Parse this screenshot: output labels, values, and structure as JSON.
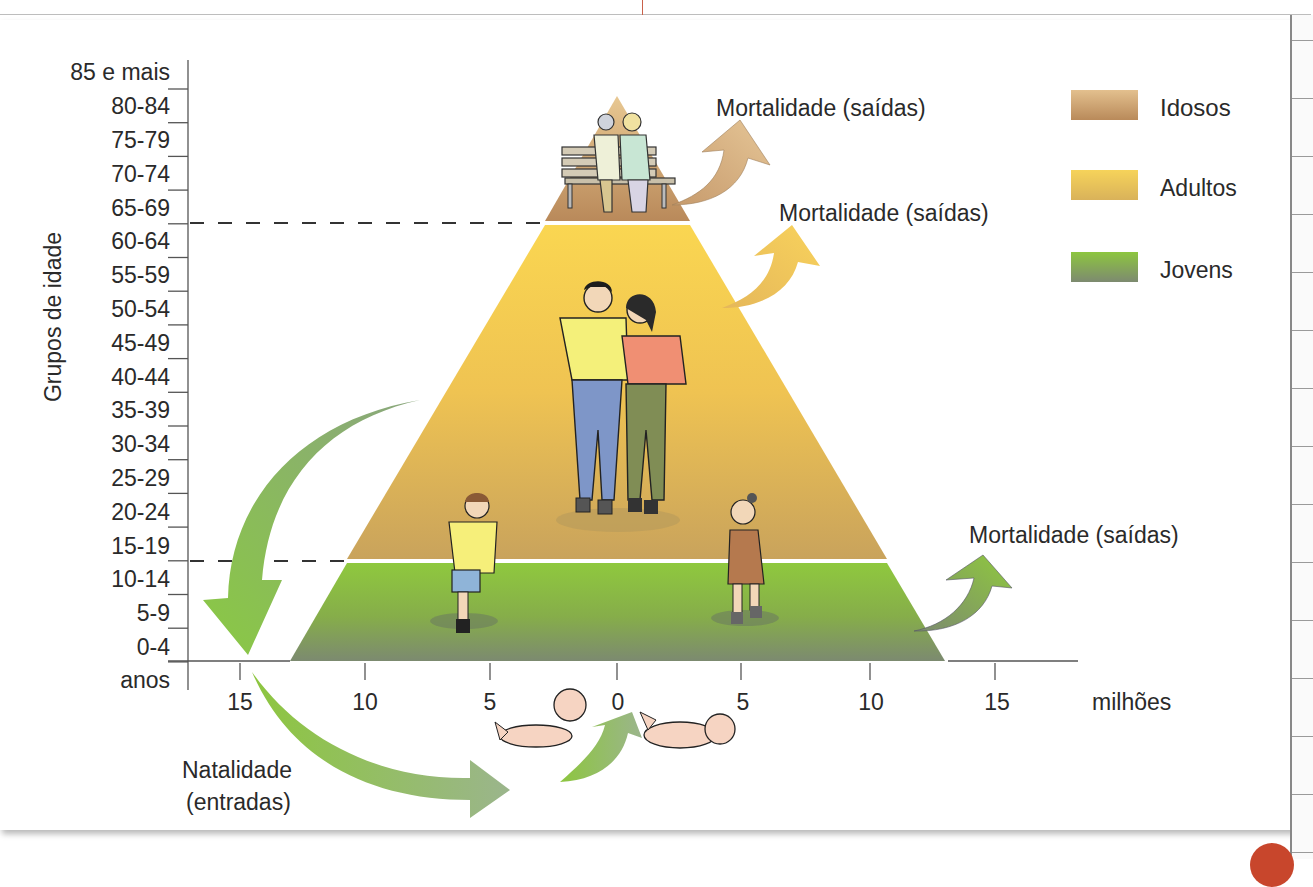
{
  "y_axis": {
    "title": "Grupos de idade",
    "unit_label": "anos",
    "age_groups": [
      "85 e mais",
      "80-84",
      "75-79",
      "70-74",
      "65-69",
      "60-64",
      "55-59",
      "50-54",
      "45-49",
      "40-44",
      "35-39",
      "30-34",
      "25-29",
      "20-24",
      "15-19",
      "10-14",
      "5-9",
      "0-4"
    ]
  },
  "x_axis": {
    "unit_label": "milhões",
    "ticks": [
      "15",
      "10",
      "5",
      "0",
      "5",
      "10",
      "15"
    ]
  },
  "legend": [
    {
      "label": "Idosos",
      "color_top": "#e3c08e",
      "color_bottom": "#b98a5a"
    },
    {
      "label": "Adultos",
      "color_top": "#f6d35a",
      "color_bottom": "#d9b25a"
    },
    {
      "label": "Jovens",
      "color_top": "#8dc63f",
      "color_bottom": "#7d8a70"
    }
  ],
  "annotations": {
    "mortality_idosos": "Mortalidade (saídas)",
    "mortality_adultos": "Mortalidade (saídas)",
    "mortality_jovens": "Mortalidade (saídas)",
    "natality_line1": "Natalidade",
    "natality_line2": "(entradas)"
  },
  "chart_data": {
    "type": "area",
    "title": "",
    "xlabel": "milhões",
    "ylabel": "Grupos de idade",
    "x_ticks": [
      15,
      10,
      5,
      0,
      5,
      10,
      15
    ],
    "xlim": [
      -17,
      17
    ],
    "categories": [
      "0-4",
      "5-9",
      "10-14",
      "15-19",
      "20-24",
      "25-29",
      "30-34",
      "35-39",
      "40-44",
      "45-49",
      "50-54",
      "55-59",
      "60-64",
      "65-69",
      "70-74",
      "75-79",
      "80-84",
      "85 e mais"
    ],
    "bands": [
      {
        "name": "Jovens",
        "age_range": [
          "0-4",
          "10-14"
        ],
        "half_width_base_millions": 13,
        "half_width_top_millions": 11
      },
      {
        "name": "Adultos",
        "age_range": [
          "15-19",
          "60-64"
        ],
        "half_width_base_millions": 11,
        "half_width_top_millions": 3
      },
      {
        "name": "Idosos",
        "age_range": [
          "65-69",
          "85 e mais"
        ],
        "half_width_base_millions": 3,
        "half_width_top_millions": 0
      }
    ],
    "flows": [
      {
        "label": "Natalidade (entradas)",
        "direction": "in",
        "band": "Jovens"
      },
      {
        "label": "Mortalidade (saídas)",
        "direction": "out",
        "band": "Jovens"
      },
      {
        "label": "Mortalidade (saídas)",
        "direction": "out",
        "band": "Adultos"
      },
      {
        "label": "Mortalidade (saídas)",
        "direction": "out",
        "band": "Idosos"
      }
    ],
    "legend_position": "top-right",
    "grid": false
  }
}
